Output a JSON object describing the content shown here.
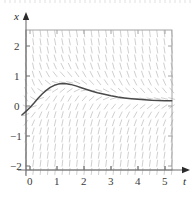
{
  "figure": {
    "kind": "direction-field-with-solution-curve",
    "background_color": "#ffffff"
  },
  "axes": {
    "x_axis_name": "t",
    "y_axis_name": "x",
    "frame_color": "#9a9a9a",
    "axis_color": "#6e6e6e",
    "tick_label_color": "#3a3a3a"
  },
  "x_ticks": [
    {
      "label": "0",
      "value": 0
    },
    {
      "label": "1",
      "value": 1
    },
    {
      "label": "2",
      "value": 2
    },
    {
      "label": "3",
      "value": 3
    },
    {
      "label": "4",
      "value": 4
    },
    {
      "label": "5",
      "value": 5
    }
  ],
  "y_ticks": [
    {
      "label": "2",
      "value": 2
    },
    {
      "label": "1",
      "value": 1
    },
    {
      "label": "0",
      "value": 0
    },
    {
      "label": "−1",
      "value": -1
    },
    {
      "label": "−2",
      "value": -2
    }
  ],
  "chart_data": {
    "type": "line",
    "title": "",
    "xlabel": "t",
    "ylabel": "x",
    "xlim": [
      -0.35,
      5.35
    ],
    "ylim": [
      -2.55,
      2.6
    ],
    "grid": false,
    "legend": "none",
    "slope_field": {
      "color": "#c9c9c9",
      "description": "short dash segments on a regular grid indicating dx/dt; steeply negative above the solution curve, steeply positive below it, shallow near the solution",
      "t_start": -0.15,
      "t_end": 5.25,
      "t_step": 0.27,
      "x_start": -2.45,
      "x_end": 2.5,
      "x_step": 0.27,
      "segment_length_px": 7
    },
    "series": [
      {
        "name": "solution curve",
        "color": "#4a4a4a",
        "points": [
          [
            -0.3,
            -0.3
          ],
          [
            -0.15,
            -0.18
          ],
          [
            0.0,
            -0.05
          ],
          [
            0.15,
            0.1
          ],
          [
            0.3,
            0.26
          ],
          [
            0.45,
            0.4
          ],
          [
            0.6,
            0.52
          ],
          [
            0.75,
            0.62
          ],
          [
            0.9,
            0.69
          ],
          [
            1.05,
            0.73
          ],
          [
            1.2,
            0.75
          ],
          [
            1.35,
            0.745
          ],
          [
            1.5,
            0.72
          ],
          [
            1.7,
            0.67
          ],
          [
            1.9,
            0.61
          ],
          [
            2.1,
            0.55
          ],
          [
            2.3,
            0.49
          ],
          [
            2.5,
            0.44
          ],
          [
            2.75,
            0.39
          ],
          [
            3.0,
            0.34
          ],
          [
            3.25,
            0.3
          ],
          [
            3.5,
            0.27
          ],
          [
            3.75,
            0.245
          ],
          [
            4.0,
            0.225
          ],
          [
            4.25,
            0.21
          ],
          [
            4.5,
            0.195
          ],
          [
            4.75,
            0.185
          ],
          [
            5.0,
            0.178
          ],
          [
            5.25,
            0.173
          ]
        ]
      }
    ]
  }
}
